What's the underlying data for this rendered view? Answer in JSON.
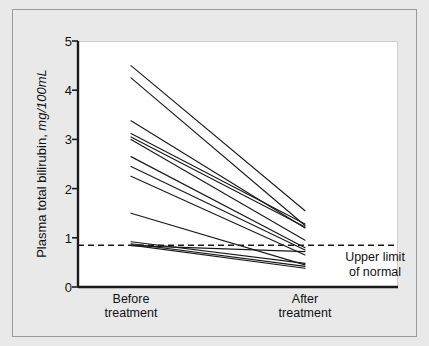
{
  "figure": {
    "background_color": "#e9e9e9",
    "panel_color": "#ffffff",
    "frame_color": "#9a9a9a",
    "line_color": "#1a1a1a"
  },
  "axis": {
    "y_title_main": "Plasma total bilirubin, ",
    "y_title_unit": "mg/100mL",
    "y_ticks": [
      "0",
      "1",
      "2",
      "3",
      "4",
      "5"
    ],
    "x_categories": [
      {
        "line1": "Before",
        "line2": "treatment"
      },
      {
        "line1": "After",
        "line2": "treatment"
      }
    ]
  },
  "annotation": {
    "upper_limit_line1": "Upper limit",
    "upper_limit_line2": "of normal"
  },
  "chart_data": {
    "type": "line",
    "title": "",
    "subtitle": "",
    "xlabel": "",
    "ylabel": "Plasma total bilirubin, mg/100mL",
    "categories": [
      "Before treatment",
      "After treatment"
    ],
    "ylim": [
      0,
      5
    ],
    "yticks": [
      0,
      1,
      2,
      3,
      4,
      5
    ],
    "grid": false,
    "legend": false,
    "marker_before": "open-circle",
    "marker_after": "filled-circle",
    "reference_line": {
      "label": "Upper limit of normal",
      "value": 0.85,
      "style": "dashed",
      "orientation": "horizontal"
    },
    "series": [
      {
        "name": "Patient 1",
        "values": [
          4.5,
          1.55
        ]
      },
      {
        "name": "Patient 2",
        "values": [
          4.25,
          1.25
        ]
      },
      {
        "name": "Patient 3",
        "values": [
          3.38,
          1.2
        ]
      },
      {
        "name": "Patient 4",
        "values": [
          3.12,
          1.28
        ]
      },
      {
        "name": "Patient 5",
        "values": [
          3.05,
          1.22
        ]
      },
      {
        "name": "Patient 6",
        "values": [
          3.0,
          0.95
        ]
      },
      {
        "name": "Patient 7",
        "values": [
          2.65,
          0.8
        ]
      },
      {
        "name": "Patient 8",
        "values": [
          2.45,
          0.75
        ]
      },
      {
        "name": "Patient 9",
        "values": [
          2.25,
          0.65
        ]
      },
      {
        "name": "Patient 10",
        "values": [
          1.5,
          0.45
        ]
      },
      {
        "name": "Patient 11",
        "values": [
          0.92,
          0.48
        ]
      },
      {
        "name": "Patient 12",
        "values": [
          0.88,
          0.42
        ]
      },
      {
        "name": "Patient 13",
        "values": [
          0.85,
          0.38
        ]
      },
      {
        "name": "Patient 14",
        "values": [
          0.84,
          0.72
        ]
      }
    ]
  }
}
